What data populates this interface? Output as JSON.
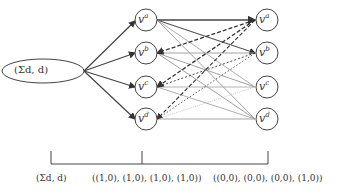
{
  "diagram": {
    "source_node": {
      "label": "(Σd, d)"
    },
    "layer1": [
      {
        "id": "a",
        "label": "v",
        "sup": "a"
      },
      {
        "id": "b",
        "label": "v",
        "sup": "b"
      },
      {
        "id": "c",
        "label": "v",
        "sup": "c"
      },
      {
        "id": "d",
        "label": "v",
        "sup": "d"
      }
    ],
    "layer2": [
      {
        "id": "a",
        "label": "v",
        "sup": "a"
      },
      {
        "id": "b",
        "label": "v",
        "sup": "b"
      },
      {
        "id": "c",
        "label": "v",
        "sup": "c"
      },
      {
        "id": "d",
        "label": "v",
        "sup": "d"
      }
    ],
    "bottom_labels": {
      "stage0": "(Σd, d)",
      "stage1": "((1,0), (1,0), (1,0), (1,0))",
      "stage2": "((0,0), (0,0), (0,0), (1,0))"
    },
    "colors": {
      "stroke": "#444444",
      "light": "#aaaaaa",
      "dashed": "#333333"
    }
  }
}
